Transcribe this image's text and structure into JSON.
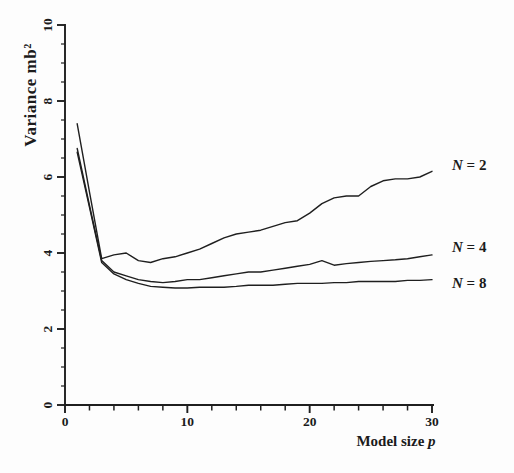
{
  "figure": {
    "background": "#fdfdfd",
    "ink_color": "#1f1f1f",
    "text_color": "#1b1b1b"
  },
  "chart_data": {
    "type": "line",
    "title": "",
    "ylabel": "Variance mb²",
    "xlabel_text": "Model size ",
    "xlabel_var": "p",
    "xlim": [
      0,
      30
    ],
    "ylim": [
      0,
      10
    ],
    "x_major_ticks": [
      0,
      10,
      20,
      30
    ],
    "x_minor_tick_step": 2,
    "y_major_ticks": [
      0,
      2,
      4,
      6,
      8,
      10
    ],
    "y_minor_tick_step": 0.5,
    "grid": false,
    "legend_position": "labels-at-line-ends",
    "x": [
      1,
      2,
      3,
      4,
      5,
      6,
      7,
      8,
      9,
      10,
      11,
      12,
      13,
      14,
      15,
      16,
      17,
      18,
      19,
      20,
      21,
      22,
      23,
      24,
      25,
      26,
      27,
      28,
      29,
      30
    ],
    "series": [
      {
        "name": "N = 2",
        "label_var": "N",
        "label_rest": " = 2",
        "values": [
          7.4,
          5.6,
          3.85,
          3.95,
          4.0,
          3.8,
          3.75,
          3.85,
          3.9,
          4.0,
          4.1,
          4.25,
          4.4,
          4.5,
          4.55,
          4.6,
          4.7,
          4.8,
          4.85,
          5.05,
          5.3,
          5.45,
          5.5,
          5.5,
          5.75,
          5.9,
          5.95,
          5.95,
          6.0,
          6.15
        ]
      },
      {
        "name": "N = 4",
        "label_var": "N",
        "label_rest": " = 4",
        "values": [
          6.75,
          5.25,
          3.8,
          3.5,
          3.4,
          3.3,
          3.25,
          3.22,
          3.25,
          3.3,
          3.3,
          3.35,
          3.4,
          3.45,
          3.5,
          3.5,
          3.55,
          3.6,
          3.65,
          3.7,
          3.8,
          3.68,
          3.72,
          3.75,
          3.78,
          3.8,
          3.82,
          3.85,
          3.9,
          3.95
        ]
      },
      {
        "name": "N = 8",
        "label_var": "N",
        "label_rest": " = 8",
        "values": [
          6.65,
          5.2,
          3.75,
          3.45,
          3.3,
          3.2,
          3.12,
          3.1,
          3.08,
          3.08,
          3.1,
          3.1,
          3.1,
          3.12,
          3.15,
          3.15,
          3.15,
          3.18,
          3.2,
          3.2,
          3.2,
          3.22,
          3.22,
          3.25,
          3.25,
          3.25,
          3.25,
          3.28,
          3.28,
          3.3
        ]
      }
    ]
  }
}
